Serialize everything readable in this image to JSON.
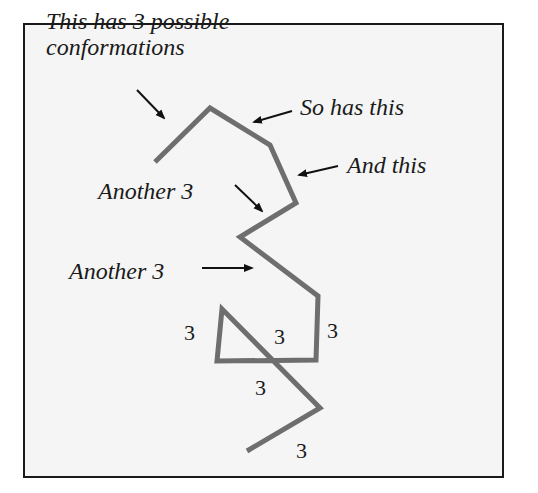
{
  "diagram": {
    "title_annotation": {
      "line1": "This has 3 possible",
      "line2": "conformations"
    },
    "annotations": [
      {
        "id": "so-has-this",
        "text": "So has this"
      },
      {
        "id": "and-this",
        "text": "And this"
      },
      {
        "id": "another-3-a",
        "text": "Another 3"
      },
      {
        "id": "another-3-b",
        "text": "Another 3"
      }
    ],
    "bond_labels": [
      "3",
      "3",
      "3",
      "3",
      "3"
    ],
    "colors": {
      "chain": "#6e6e6e",
      "arrow": "#111111",
      "background": "#f5f5f5",
      "frame": "#1a1a1a"
    },
    "chain_points": [
      [
        155,
        162
      ],
      [
        210,
        108
      ],
      [
        270,
        145
      ],
      [
        296,
        203
      ],
      [
        240,
        237
      ],
      [
        318,
        296
      ],
      [
        316,
        360
      ],
      [
        217,
        361
      ],
      [
        222,
        309
      ],
      [
        320,
        408
      ],
      [
        247,
        451
      ]
    ]
  }
}
